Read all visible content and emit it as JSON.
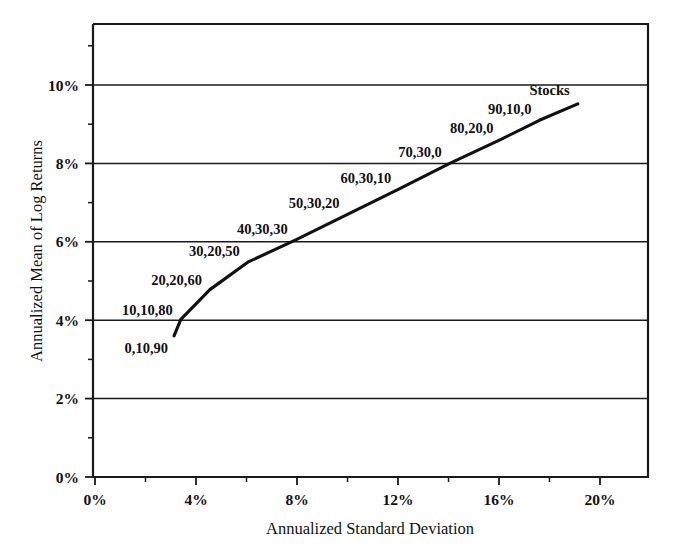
{
  "chart_data": {
    "type": "line",
    "title": "",
    "xlabel": "Annualized Standard Deviation",
    "ylabel": "Annualized Mean of Log Returns",
    "xlim": [
      0,
      22
    ],
    "ylim": [
      0,
      11.55
    ],
    "grid": true,
    "legend": "none",
    "x_tick_labels": [
      "0%",
      "4%",
      "8%",
      "12%",
      "16%",
      "20%"
    ],
    "x_tick_values": [
      0,
      4,
      8,
      12,
      16,
      20
    ],
    "x_minor_tick_values": [
      2,
      6,
      10,
      14,
      18
    ],
    "y_tick_labels": [
      "0%",
      "2%",
      "4%",
      "6%",
      "8%",
      "10%"
    ],
    "y_tick_values": [
      0,
      2,
      4,
      6,
      8,
      10
    ],
    "y_minor_tick_values": [
      1,
      3,
      5,
      7,
      9,
      11
    ],
    "series": [
      {
        "name": "Efficient frontier",
        "x": [
          3.13,
          3.4,
          4.55,
          6.05,
          7.95,
          10.0,
          12.05,
          14.05,
          16.1,
          17.6,
          19.12
        ],
        "y": [
          3.6,
          4.02,
          4.78,
          5.48,
          6.05,
          6.7,
          7.35,
          8.0,
          8.62,
          9.1,
          9.52
        ]
      }
    ],
    "point_labels": [
      {
        "text": "0,10,90",
        "x": 3.13,
        "y": 3.6
      },
      {
        "text": "10,10,80",
        "x": 3.4,
        "y": 4.02
      },
      {
        "text": "20,20,60",
        "x": 4.55,
        "y": 4.78
      },
      {
        "text": "30,20,50",
        "x": 6.05,
        "y": 5.48
      },
      {
        "text": "40,30,30",
        "x": 7.95,
        "y": 6.05
      },
      {
        "text": "50,30,20",
        "x": 10.0,
        "y": 6.7
      },
      {
        "text": "60,30,10",
        "x": 12.05,
        "y": 7.35
      },
      {
        "text": "70,30,0",
        "x": 14.05,
        "y": 8.0
      },
      {
        "text": "80,20,0",
        "x": 16.1,
        "y": 8.62
      },
      {
        "text": "90,10,0",
        "x": 17.6,
        "y": 9.1
      },
      {
        "text": "Stocks",
        "x": 19.12,
        "y": 9.52
      }
    ],
    "annotations": [
      "0,10,90",
      "10,10,80",
      "20,20,60",
      "30,20,50",
      "40,30,30",
      "50,30,20",
      "60,30,10",
      "70,30,0",
      "80,20,0",
      "90,10,0",
      "Stocks"
    ]
  },
  "axes": {
    "x_title": "Annualized Standard Deviation",
    "y_title": "Annualized Mean of Log Returns",
    "x_ticks": [
      {
        "label": "0%",
        "value": 0
      },
      {
        "label": "4%",
        "value": 4
      },
      {
        "label": "8%",
        "value": 8
      },
      {
        "label": "12%",
        "value": 12
      },
      {
        "label": "16%",
        "value": 16
      },
      {
        "label": "20%",
        "value": 20
      }
    ],
    "y_ticks": [
      {
        "label": "0%",
        "value": 0
      },
      {
        "label": "2%",
        "value": 2
      },
      {
        "label": "4%",
        "value": 4
      },
      {
        "label": "6%",
        "value": 6
      },
      {
        "label": "8%",
        "value": 8
      },
      {
        "label": "10%",
        "value": 10
      }
    ]
  },
  "labels": {
    "p0": "0,10,90",
    "p1": "10,10,80",
    "p2": "20,20,60",
    "p3": "30,20,50",
    "p4": "40,30,30",
    "p5": "50,30,20",
    "p6": "60,30,10",
    "p7": "70,30,0",
    "p8": "80,20,0",
    "p9": "90,10,0",
    "p10": "Stocks"
  },
  "colors": {
    "ink": "#111111",
    "background": "#ffffff",
    "grid": "#1a1a1a"
  }
}
